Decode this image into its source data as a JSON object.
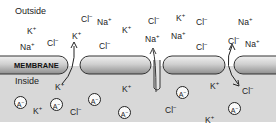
{
  "diagram": {
    "regions": {
      "outside": "Outside",
      "inside": "Inside",
      "membrane": "MEMBRANE"
    },
    "colors": {
      "inside_bg": "#d8d8d8",
      "membrane_light": "#e8e8e8",
      "membrane_dark": "#9a9a9a",
      "stroke": "#333333",
      "text": "#222222"
    },
    "outside_ions": [
      {
        "label": "K+",
        "x": 27,
        "y": 25
      },
      {
        "label": "Na+",
        "x": 20,
        "y": 41
      },
      {
        "label": "Cl-",
        "x": 47,
        "y": 37
      },
      {
        "label": "Cl-",
        "x": 81,
        "y": 13
      },
      {
        "label": "Na+",
        "x": 97,
        "y": 16
      },
      {
        "label": "K+",
        "x": 72,
        "y": 30
      },
      {
        "label": "K+",
        "x": 122,
        "y": 24
      },
      {
        "label": "Cl-",
        "x": 99,
        "y": 40
      },
      {
        "label": "Cl-",
        "x": 148,
        "y": 15
      },
      {
        "label": "K+",
        "x": 176,
        "y": 12
      },
      {
        "label": "Cl-",
        "x": 196,
        "y": 16
      },
      {
        "label": "Na+",
        "x": 145,
        "y": 33
      },
      {
        "label": "Na+",
        "x": 171,
        "y": 30
      },
      {
        "label": "Cl-",
        "x": 196,
        "y": 41
      },
      {
        "label": "Na+",
        "x": 238,
        "y": 16
      },
      {
        "label": "Cl-",
        "x": 228,
        "y": 35
      },
      {
        "label": "Na+",
        "x": 245,
        "y": 38
      }
    ],
    "inside_ions": [
      {
        "label": "K+",
        "x": 55,
        "y": 81
      },
      {
        "label": "K+",
        "x": 122,
        "y": 83
      },
      {
        "label": "K+",
        "x": 33,
        "y": 105
      },
      {
        "label": "Cl-",
        "x": 70,
        "y": 106
      },
      {
        "label": "K+",
        "x": 210,
        "y": 80
      },
      {
        "label": "Cl-",
        "x": 242,
        "y": 85
      },
      {
        "label": "Cl-",
        "x": 165,
        "y": 104
      },
      {
        "label": "K+",
        "x": 205,
        "y": 114
      }
    ],
    "anions": [
      {
        "label": "A-",
        "x": 14,
        "y": 96
      },
      {
        "label": "A-",
        "x": 50,
        "y": 98
      },
      {
        "label": "A-",
        "x": 88,
        "y": 93
      },
      {
        "label": "A-",
        "x": 118,
        "y": 106
      },
      {
        "label": "A-",
        "x": 176,
        "y": 86
      },
      {
        "label": "A-",
        "x": 228,
        "y": 102
      }
    ],
    "channels": [
      {
        "ion": "K+",
        "direction": "outward",
        "x": 73
      },
      {
        "ion": "Na+",
        "direction": "inward",
        "x": 157
      },
      {
        "ion": "Cl-",
        "direction": "inward",
        "x": 230
      }
    ]
  }
}
